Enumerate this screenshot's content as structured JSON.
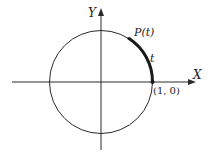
{
  "diagram": {
    "colors": {
      "stroke": "#2a2a2a",
      "background": "#ffffff"
    },
    "axes": {
      "x_label": "X",
      "y_label": "Y"
    },
    "circle": {
      "description": "unit circle centered at origin"
    },
    "points": {
      "start": {
        "label": "(1, 0)"
      },
      "end": {
        "label": "P(t)"
      }
    },
    "arc": {
      "label": "t"
    }
  }
}
